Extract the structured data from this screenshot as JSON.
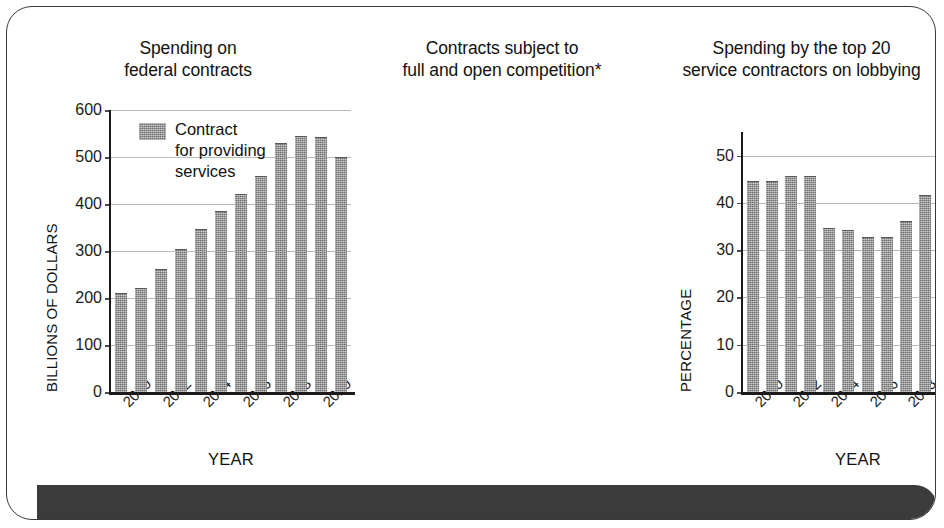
{
  "figure": {
    "footer_band_color": "#3b3b3b",
    "frame_border_color": "#3a3a3a",
    "bar_color": "#6e6e6e",
    "gridline_color": "#b9b9b9"
  },
  "legend": {
    "label_line1": "Contract",
    "label_line2": "for providing",
    "label_line3": "services",
    "swatch_name": "contract-services-swatch"
  },
  "chart_data": [
    {
      "type": "bar",
      "title": "Spending on federal contracts",
      "title_line1": "Spending on",
      "title_line2": "federal contracts",
      "xlabel": "YEAR",
      "ylabel": "BILLIONS OF DOLLARS",
      "categories": [
        "2000",
        "2001",
        "2002",
        "2003",
        "2004",
        "2005",
        "2006",
        "2007",
        "2008",
        "2009",
        "2010",
        "2011"
      ],
      "tick_labels": [
        "2000",
        "",
        "2002",
        "",
        "2004",
        "",
        "2006",
        "",
        "2008",
        "",
        "2010",
        ""
      ],
      "values": [
        208,
        220,
        260,
        302,
        345,
        383,
        420,
        458,
        528,
        543,
        540,
        498
      ],
      "ylim": [
        0,
        600
      ],
      "yticks": [
        0,
        100,
        200,
        300,
        400,
        500,
        600
      ],
      "grid": true,
      "legend_position": "upper-left-inside"
    },
    {
      "type": "bar",
      "title": "Contracts subject to full and open competition*",
      "title_line1": "Contracts subject to",
      "title_line2": "full and open competition*",
      "xlabel": "YEAR",
      "ylabel": "PERCENTAGE",
      "categories": [
        "2000",
        "2001",
        "2002",
        "2003",
        "2004",
        "2005",
        "2006",
        "2007",
        "2008",
        "2009",
        "2010",
        "2011"
      ],
      "tick_labels": [
        "2000",
        "",
        "2002",
        "",
        "2004",
        "",
        "2006",
        "",
        "2008",
        "",
        "2010",
        ""
      ],
      "values": [
        44.5,
        44.5,
        45.5,
        45.5,
        34.5,
        34.0,
        32.5,
        32.5,
        36.0,
        41.5,
        43.0,
        42.0
      ],
      "ylim": [
        0,
        55
      ],
      "yticks": [
        0,
        10,
        20,
        30,
        40,
        50
      ],
      "grid": true,
      "legend_position": "none"
    },
    {
      "type": "bar",
      "title": "Spending by the top 20 service contractors on lobbying",
      "title_line1": "Spending by the top 20",
      "title_line2": "service contractors on lobbying",
      "xlabel": "YEAR",
      "ylabel": "MILLIONS OF DOLLARS",
      "categories": [
        "2006",
        "2007",
        "2008",
        "2009",
        "2010"
      ],
      "tick_labels": [
        "2006",
        "2007",
        "2008",
        "2009",
        "2010"
      ],
      "values": [
        90,
        93,
        125.5,
        124.5,
        143
      ],
      "ylim": [
        0,
        148
      ],
      "yticks": [
        0,
        20,
        40,
        60,
        80,
        100,
        120,
        140
      ],
      "grid": true,
      "legend_position": "none"
    }
  ]
}
